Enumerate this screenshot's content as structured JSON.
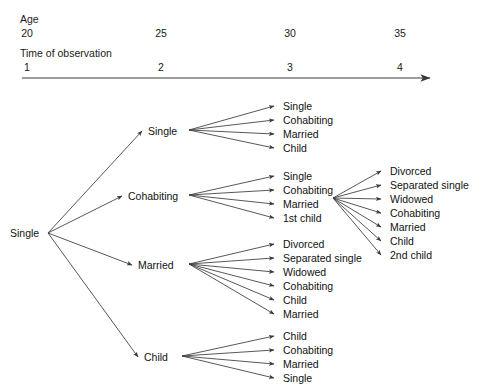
{
  "figure": {
    "background_color": "#ffffff",
    "line_color": "#3a3a3a",
    "text_color": "#1a1a1a"
  },
  "axis": {
    "age_header": "Age",
    "time_header": "Time of observation",
    "age_ticks": [
      "20",
      "25",
      "30",
      "35"
    ],
    "time_ticks": [
      "1",
      "2",
      "3",
      "4"
    ],
    "tick_x": [
      27,
      161,
      290,
      400
    ],
    "arrow_from_x": 22,
    "arrow_to_x": 430,
    "arrow_y": 78
  },
  "tree": {
    "root": {
      "label": "Single",
      "x": 10,
      "y": 227
    },
    "level2": [
      {
        "label": "Single",
        "x": 148,
        "y": 125
      },
      {
        "label": "Cohabiting",
        "x": 128,
        "y": 190
      },
      {
        "label": "Married",
        "x": 138,
        "y": 259
      },
      {
        "label": "Child",
        "x": 144,
        "y": 351
      }
    ],
    "groups": [
      {
        "name": "from-single",
        "hub_x": 189,
        "hub_y": 130,
        "leaf_x": 283,
        "leaves": [
          {
            "label": "Single",
            "y": 100
          },
          {
            "label": "Cohabiting",
            "y": 114
          },
          {
            "label": "Married",
            "y": 128
          },
          {
            "label": "Child",
            "y": 142
          }
        ]
      },
      {
        "name": "from-cohabiting",
        "hub_x": 189,
        "hub_y": 195,
        "leaf_x": 283,
        "leaves": [
          {
            "label": "Single",
            "y": 170
          },
          {
            "label": "Cohabiting",
            "y": 184
          },
          {
            "label": "Married",
            "y": 198,
            "is_hub": true
          },
          {
            "label": "1st child",
            "y": 212
          }
        ]
      },
      {
        "name": "from-married",
        "hub_x": 189,
        "hub_y": 264,
        "leaf_x": 283,
        "leaves": [
          {
            "label": "Divorced",
            "y": 238
          },
          {
            "label": "Separated single",
            "y": 252
          },
          {
            "label": "Widowed",
            "y": 266
          },
          {
            "label": "Cohabiting",
            "y": 280
          },
          {
            "label": "Child",
            "y": 294
          },
          {
            "label": "Married",
            "y": 308
          }
        ]
      },
      {
        "name": "from-child",
        "hub_x": 182,
        "hub_y": 356,
        "leaf_x": 283,
        "leaves": [
          {
            "label": "Child",
            "y": 330
          },
          {
            "label": "Cohabiting",
            "y": 344
          },
          {
            "label": "Married",
            "y": 358
          },
          {
            "label": "Single",
            "y": 372
          }
        ]
      },
      {
        "name": "from-married-second-wave",
        "hub_x": 333,
        "hub_y": 198,
        "leaf_x": 390,
        "leaves": [
          {
            "label": "Divorced",
            "y": 165
          },
          {
            "label": "Separated single",
            "y": 179
          },
          {
            "label": "Widowed",
            "y": 193
          },
          {
            "label": "Cohabiting",
            "y": 207
          },
          {
            "label": "Married",
            "y": 221
          },
          {
            "label": "Child",
            "y": 235
          },
          {
            "label": "2nd child",
            "y": 249
          }
        ]
      }
    ]
  }
}
